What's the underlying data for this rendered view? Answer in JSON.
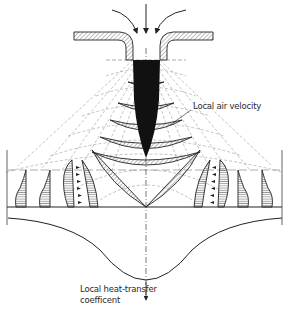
{
  "diagram": {
    "type": "technical-illustration",
    "labels": {
      "air_velocity": "Local air velocity",
      "heat_transfer_line1": "Local heat-transfer",
      "heat_transfer_line2": "coefficent"
    },
    "elements": [
      "inflow-arrows",
      "nozzle-plate-left",
      "nozzle-plate-right",
      "jet-core",
      "velocity-profiles",
      "streamlines",
      "impingement-surface",
      "heat-transfer-curve",
      "center-axis"
    ],
    "colors": {
      "ink": "#1a1a1a",
      "dash": "#7a7a7a",
      "hatch": "#555555",
      "background": "#ffffff"
    }
  }
}
